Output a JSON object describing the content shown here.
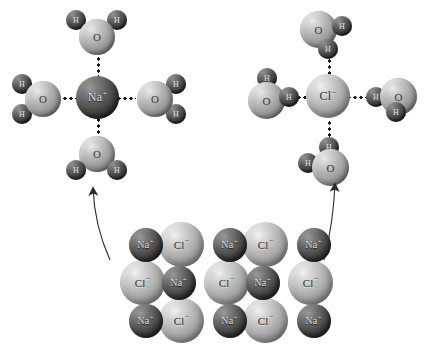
{
  "figure": {
    "type": "molecular-diagram",
    "background_color": "#ffffff"
  },
  "labels": {
    "sodium_ion": "Na",
    "sodium_charge": "+",
    "chloride_ion": "Cl",
    "chloride_charge": "−",
    "oxygen": "O",
    "hydrogen": "H"
  },
  "colors": {
    "cation_sphere": "#414141",
    "anion_sphere": "#a6a6a6",
    "oxygen_sphere": "#999999",
    "hydrogen_sphere": "#3c3c3c",
    "bond_dots": "#1a1a1a",
    "arrow": "#2b2b2b",
    "cation_text": "#dedede",
    "anion_text": "#2a2a2a"
  },
  "hydrated_cation": {
    "name": "hydrated-sodium-ion",
    "center_ion": "Na",
    "center_charge": "+",
    "water_count": 4,
    "water_orientation": "oxygen-toward-ion",
    "waters": [
      {
        "position": "top",
        "atom_facing_ion": "O"
      },
      {
        "position": "left",
        "atom_facing_ion": "O"
      },
      {
        "position": "right",
        "atom_facing_ion": "O"
      },
      {
        "position": "bottom",
        "atom_facing_ion": "O"
      }
    ]
  },
  "hydrated_anion": {
    "name": "hydrated-chloride-ion",
    "center_ion": "Cl",
    "center_charge": "−",
    "water_count": 4,
    "water_orientation": "hydrogen-toward-ion",
    "waters": [
      {
        "position": "top",
        "atom_facing_ion": "H"
      },
      {
        "position": "left",
        "atom_facing_ion": "H"
      },
      {
        "position": "right",
        "atom_facing_ion": "H"
      },
      {
        "position": "bottom",
        "atom_facing_ion": "H"
      }
    ]
  },
  "crystal_lattice": {
    "name": "sodium-chloride-crystal",
    "rows": 3,
    "columns": 5,
    "grid": [
      [
        "Na",
        "Cl",
        "Na",
        "Cl",
        "Na"
      ],
      [
        "Cl",
        "Na",
        "Cl",
        "Na",
        "Cl"
      ],
      [
        "Na",
        "Cl",
        "Na",
        "Cl",
        "Na"
      ]
    ],
    "charges": [
      [
        "+",
        "−",
        "+",
        "−",
        "+"
      ],
      [
        "−",
        "+",
        "−",
        "+",
        "−"
      ],
      [
        "+",
        "−",
        "+",
        "−",
        "+"
      ]
    ]
  },
  "arrows": [
    {
      "name": "arrow-to-hydrated-cation",
      "from": "crystal-lattice",
      "to": "hydrated-sodium-ion",
      "direction": "up-left"
    },
    {
      "name": "arrow-to-hydrated-anion",
      "from": "crystal-lattice",
      "to": "hydrated-chloride-ion",
      "direction": "up-right"
    }
  ]
}
